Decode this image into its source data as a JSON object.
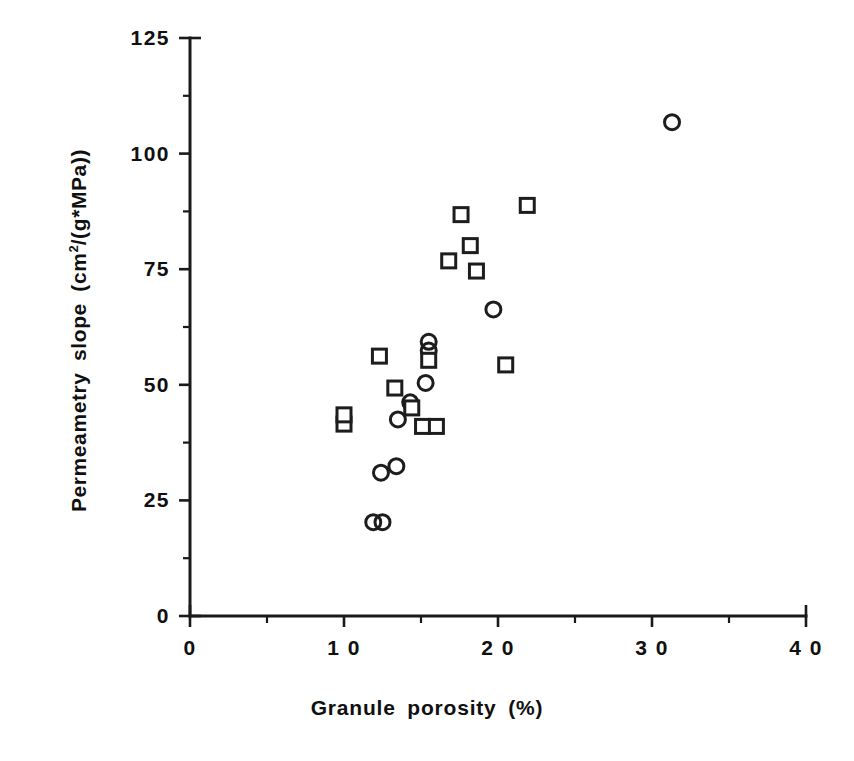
{
  "chart_data": {
    "type": "scatter",
    "title": "",
    "xlabel": "Granule porosity (%)",
    "ylabel_parts": {
      "prefix": "Permeametry  slope  (cm",
      "superscript": "2",
      "suffix": "/(g*MPa))"
    },
    "ylabel": "Permeametry slope (cm2/(g*MPa))",
    "xlim": [
      0,
      40
    ],
    "ylim": [
      0,
      125
    ],
    "xticks": [
      0,
      10,
      20,
      30,
      40
    ],
    "xtick_labels": [
      "0",
      "1 0",
      "2 0",
      "3 0",
      "4 0"
    ],
    "xminor_interval": 5,
    "yticks": [
      0,
      25,
      50,
      75,
      100,
      125
    ],
    "ytick_labels": [
      "0",
      "25",
      "50",
      "75",
      "100",
      "125"
    ],
    "yminor_interval": 12.5,
    "grid": false,
    "legend": null,
    "series": [
      {
        "name": "circles",
        "marker": "circle",
        "points": [
          [
            11.9,
            20.3
          ],
          [
            12.5,
            20.3
          ],
          [
            12.4,
            31.0
          ],
          [
            13.4,
            32.4
          ],
          [
            13.5,
            42.5
          ],
          [
            14.3,
            46.2
          ],
          [
            15.3,
            50.4
          ],
          [
            15.5,
            57.4
          ],
          [
            15.5,
            59.3
          ],
          [
            19.7,
            66.3
          ],
          [
            31.3,
            106.8
          ]
        ]
      },
      {
        "name": "squares",
        "marker": "square",
        "points": [
          [
            10.0,
            41.5
          ],
          [
            10.0,
            43.5
          ],
          [
            12.3,
            56.2
          ],
          [
            13.3,
            49.3
          ],
          [
            14.4,
            45.0
          ],
          [
            15.1,
            41.0
          ],
          [
            15.5,
            55.3
          ],
          [
            16.0,
            41.0
          ],
          [
            16.8,
            76.8
          ],
          [
            17.6,
            86.8
          ],
          [
            18.2,
            80.1
          ],
          [
            18.6,
            74.6
          ],
          [
            20.5,
            54.3
          ],
          [
            21.9,
            88.8
          ]
        ]
      }
    ]
  },
  "axes_geometry": {
    "x_origin_px": 190,
    "y_origin_px": 616,
    "x_scale_px_per_unit": 15.4,
    "y_scale_px_per_unit": 4.624
  }
}
